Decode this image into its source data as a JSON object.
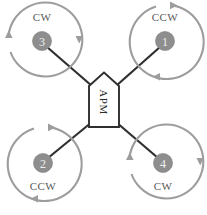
{
  "diagram": {
    "canvas": {
      "width": 207,
      "height": 215
    },
    "colors": {
      "background": "#ffffff",
      "arm": "#2f2f2f",
      "arc": "#9d9d9d",
      "motor_fill": "#8e8e8e",
      "motor_number": "#efefef",
      "body_stroke": "#2f2f2f",
      "body_fill": "#ffffff",
      "label_text": "#5a5a5a"
    },
    "controller": {
      "label": "APM",
      "shape": "pentagon-up",
      "text_rotation_deg": 90
    },
    "motors": [
      {
        "id": "motor-3",
        "number": "3",
        "rotation": "CW",
        "position": "top-left",
        "cx": 42,
        "cy": 41,
        "r": 9.5,
        "arc_radius": 37,
        "label_x": 42,
        "label_y": 18
      },
      {
        "id": "motor-1",
        "number": "1",
        "rotation": "CCW",
        "position": "top-right",
        "cx": 165,
        "cy": 41,
        "r": 9.5,
        "arc_radius": 37,
        "label_x": 165,
        "label_y": 18
      },
      {
        "id": "motor-2",
        "number": "2",
        "rotation": "CCW",
        "position": "bottom-left",
        "cx": 43,
        "cy": 163,
        "r": 9.5,
        "arc_radius": 37,
        "label_x": 43,
        "label_y": 187
      },
      {
        "id": "motor-4",
        "number": "4",
        "rotation": "CW",
        "position": "bottom-right",
        "cx": 163,
        "cy": 163,
        "r": 9.5,
        "arc_radius": 37,
        "label_x": 163,
        "label_y": 187
      }
    ]
  }
}
